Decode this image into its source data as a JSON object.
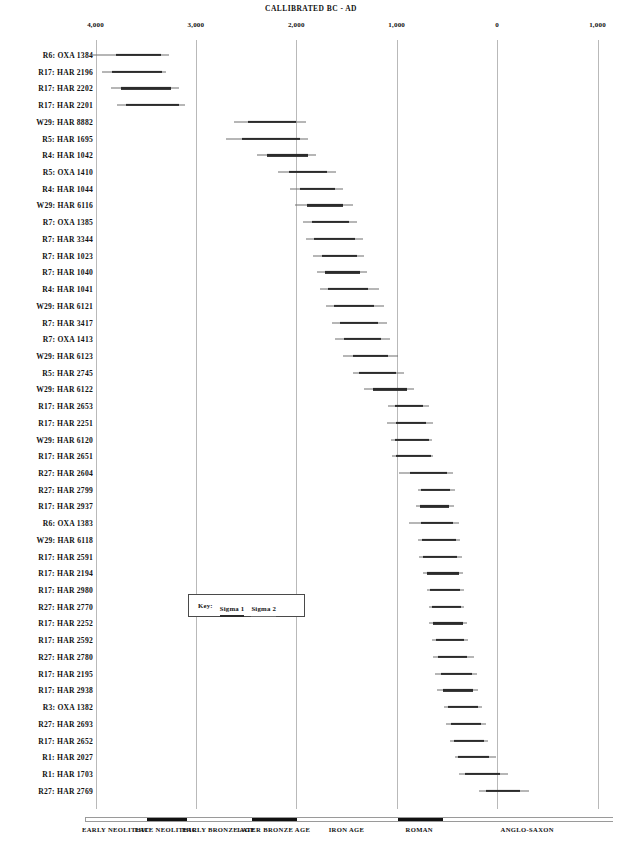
{
  "chart_data": {
    "type": "range-bar",
    "title": "CALLIBRATED BC - AD",
    "xlabel": "CALLIBRATED BC - AD",
    "ylabel": "",
    "grid": true,
    "legend_position": "inset-left-middle",
    "axis": {
      "orientation": "bc-ad",
      "ticks": [
        {
          "label": "4,000",
          "value": -4000
        },
        {
          "label": "3,000",
          "value": -3000
        },
        {
          "label": "2,000",
          "value": -2000
        },
        {
          "label": "1,000",
          "value": -1000
        },
        {
          "label": "0",
          "value": 0
        },
        {
          "label": "1,000",
          "value": 1000
        }
      ],
      "xlim": [
        -4200,
        1200
      ]
    },
    "key": {
      "title": "Key:",
      "entries": [
        {
          "label": "Sigma 1",
          "style": "thick"
        },
        {
          "label": "Sigma 2",
          "style": "thin"
        }
      ]
    },
    "periods": [
      {
        "label": "EARLY NEOLITHIC",
        "start": -4100,
        "end": -3500,
        "fill": "light"
      },
      {
        "label": "LATE NEOLITHIC",
        "start": -3500,
        "end": -3100,
        "fill": "dark"
      },
      {
        "label": "EARLY BRONZE AGE",
        "start": -3100,
        "end": -2450,
        "fill": "light"
      },
      {
        "label": "LATER BRONZE AGE",
        "start": -2450,
        "end": -2000,
        "fill": "dark"
      },
      {
        "label": "IRON AGE",
        "start": -2000,
        "end": -1000,
        "fill": "light"
      },
      {
        "label": "ROMAN",
        "start": -1000,
        "end": -550,
        "fill": "dark"
      },
      {
        "label": "ANGLO-SAXON",
        "start": -550,
        "end": 1150,
        "fill": "light"
      }
    ],
    "series_names": [
      "Sigma 1",
      "Sigma 2"
    ],
    "samples": [
      {
        "label": "R6: OXA 1384",
        "sigma2": [
          -4050,
          -3270
        ],
        "sigma1": [
          -3800,
          -3350
        ]
      },
      {
        "label": "R17: HAR 2196",
        "sigma2": [
          -3940,
          -3300
        ],
        "sigma1": [
          -3840,
          -3340
        ]
      },
      {
        "label": "R17: HAR 2202",
        "sigma2": [
          -3850,
          -3170
        ],
        "sigma1": [
          -3750,
          -3250
        ]
      },
      {
        "label": "R17: HAR 2201",
        "sigma2": [
          -3790,
          -3110
        ],
        "sigma1": [
          -3700,
          -3170
        ]
      },
      {
        "label": "W29: HAR 8882",
        "sigma2": [
          -2620,
          -1900
        ],
        "sigma1": [
          -2480,
          -2000
        ]
      },
      {
        "label": "R5: HAR 1695",
        "sigma2": [
          -2700,
          -1880
        ],
        "sigma1": [
          -2540,
          -1960
        ]
      },
      {
        "label": "R4: HAR 1042",
        "sigma2": [
          -2390,
          -1800
        ],
        "sigma1": [
          -2290,
          -1880
        ]
      },
      {
        "label": "R5: OXA 1410",
        "sigma2": [
          -2180,
          -1600
        ],
        "sigma1": [
          -2070,
          -1690
        ]
      },
      {
        "label": "R4: HAR 1044",
        "sigma2": [
          -2060,
          -1530
        ],
        "sigma1": [
          -1960,
          -1610
        ]
      },
      {
        "label": "W29: HAR 6116",
        "sigma2": [
          -2010,
          -1440
        ],
        "sigma1": [
          -1890,
          -1530
        ]
      },
      {
        "label": "R7: OXA 1385",
        "sigma2": [
          -1930,
          -1400
        ],
        "sigma1": [
          -1840,
          -1480
        ]
      },
      {
        "label": "R7: HAR 3344",
        "sigma2": [
          -1900,
          -1340
        ],
        "sigma1": [
          -1820,
          -1420
        ]
      },
      {
        "label": "R7: HAR 1023",
        "sigma2": [
          -1830,
          -1330
        ],
        "sigma1": [
          -1740,
          -1400
        ]
      },
      {
        "label": "R7: HAR 1040",
        "sigma2": [
          -1790,
          -1300
        ],
        "sigma1": [
          -1710,
          -1370
        ]
      },
      {
        "label": "R4: HAR 1041",
        "sigma2": [
          -1760,
          -1180
        ],
        "sigma1": [
          -1680,
          -1290
        ]
      },
      {
        "label": "W29: HAR 6121",
        "sigma2": [
          -1700,
          -1130
        ],
        "sigma1": [
          -1620,
          -1230
        ]
      },
      {
        "label": "R7: HAR 3417",
        "sigma2": [
          -1640,
          -1100
        ],
        "sigma1": [
          -1560,
          -1190
        ]
      },
      {
        "label": "R7: OXA 1413",
        "sigma2": [
          -1610,
          -1070
        ],
        "sigma1": [
          -1520,
          -1160
        ]
      },
      {
        "label": "W29: HAR 6123",
        "sigma2": [
          -1530,
          -990
        ],
        "sigma1": [
          -1440,
          -1090
        ]
      },
      {
        "label": "R5: HAR 2745",
        "sigma2": [
          -1440,
          -930
        ],
        "sigma1": [
          -1380,
          -1010
        ]
      },
      {
        "label": "W29: HAR 6122",
        "sigma2": [
          -1330,
          -830
        ],
        "sigma1": [
          -1240,
          -900
        ]
      },
      {
        "label": "R17: HAR 2653",
        "sigma2": [
          -1090,
          -680
        ],
        "sigma1": [
          -1020,
          -740
        ]
      },
      {
        "label": "R17: HAR 2251",
        "sigma2": [
          -1100,
          -640
        ],
        "sigma1": [
          -1010,
          -710
        ]
      },
      {
        "label": "W29: HAR 6120",
        "sigma2": [
          -1060,
          -650
        ],
        "sigma1": [
          -1020,
          -680
        ]
      },
      {
        "label": "R17: HAR 2651",
        "sigma2": [
          -1050,
          -640
        ],
        "sigma1": [
          -1010,
          -660
        ]
      },
      {
        "label": "R27: HAR 2604",
        "sigma2": [
          -980,
          -440
        ],
        "sigma1": [
          -870,
          -500
        ]
      },
      {
        "label": "R27: HAR 2799",
        "sigma2": [
          -790,
          -420
        ],
        "sigma1": [
          -760,
          -470
        ]
      },
      {
        "label": "R17: HAR 2937",
        "sigma2": [
          -810,
          -430
        ],
        "sigma1": [
          -770,
          -480
        ]
      },
      {
        "label": "R6: OXA 1383",
        "sigma2": [
          -880,
          -380
        ],
        "sigma1": [
          -760,
          -440
        ]
      },
      {
        "label": "W29: HAR 6118",
        "sigma2": [
          -790,
          -370
        ],
        "sigma1": [
          -750,
          -410
        ]
      },
      {
        "label": "R17: HAR 2591",
        "sigma2": [
          -780,
          -350
        ],
        "sigma1": [
          -740,
          -400
        ]
      },
      {
        "label": "R17: HAR 2194",
        "sigma2": [
          -740,
          -340
        ],
        "sigma1": [
          -700,
          -380
        ]
      },
      {
        "label": "R17: HAR 2980",
        "sigma2": [
          -700,
          -330
        ],
        "sigma1": [
          -670,
          -370
        ]
      },
      {
        "label": "R27: HAR 2770",
        "sigma2": [
          -680,
          -330
        ],
        "sigma1": [
          -650,
          -360
        ]
      },
      {
        "label": "R17: HAR 2252",
        "sigma2": [
          -680,
          -300
        ],
        "sigma1": [
          -640,
          -340
        ]
      },
      {
        "label": "R17: HAR 2592",
        "sigma2": [
          -650,
          -290
        ],
        "sigma1": [
          -610,
          -330
        ]
      },
      {
        "label": "R27: HAR 2780",
        "sigma2": [
          -640,
          -230
        ],
        "sigma1": [
          -590,
          -300
        ]
      },
      {
        "label": "R17: HAR 2195",
        "sigma2": [
          -620,
          -200
        ],
        "sigma1": [
          -560,
          -250
        ]
      },
      {
        "label": "R17: HAR 2938",
        "sigma2": [
          -600,
          -190
        ],
        "sigma1": [
          -540,
          -240
        ]
      },
      {
        "label": "R3: OXA 1382",
        "sigma2": [
          -530,
          -150
        ],
        "sigma1": [
          -490,
          -190
        ]
      },
      {
        "label": "R27: HAR 2693",
        "sigma2": [
          -510,
          -110
        ],
        "sigma1": [
          -460,
          -160
        ]
      },
      {
        "label": "R17: HAR 2652",
        "sigma2": [
          -470,
          -90
        ],
        "sigma1": [
          -430,
          -130
        ]
      },
      {
        "label": "R1: HAR 2027",
        "sigma2": [
          -420,
          -10
        ],
        "sigma1": [
          -390,
          -80
        ]
      },
      {
        "label": "R1: HAR 1703",
        "sigma2": [
          -380,
          110
        ],
        "sigma1": [
          -320,
          30
        ]
      },
      {
        "label": "R27: HAR 2769",
        "sigma2": [
          -180,
          320
        ],
        "sigma1": [
          -110,
          230
        ]
      }
    ]
  }
}
